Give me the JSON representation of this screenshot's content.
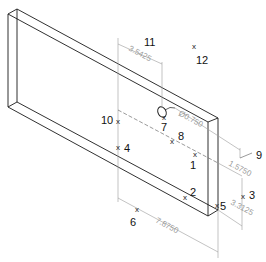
{
  "drawing": {
    "view": "isometric",
    "part": "rectangular plate with hole",
    "colors": {
      "outline": "#1a1a1a",
      "dimension": "#9a9a9a",
      "label": "#111111"
    }
  },
  "dimensions": [
    {
      "id": "dim-width-offset",
      "value": "3.5425"
    },
    {
      "id": "dim-hole-diameter",
      "value": "Ø0.750"
    },
    {
      "id": "dim-right-offset",
      "value": "1.5750"
    },
    {
      "id": "dim-height",
      "value": "3.3125"
    },
    {
      "id": "dim-length",
      "value": "7.8750"
    }
  ],
  "points": [
    {
      "id": "1",
      "label": "1"
    },
    {
      "id": "2",
      "label": "2"
    },
    {
      "id": "3",
      "label": "3"
    },
    {
      "id": "4",
      "label": "4"
    },
    {
      "id": "5",
      "label": "5"
    },
    {
      "id": "6",
      "label": "6"
    },
    {
      "id": "7",
      "label": "7"
    },
    {
      "id": "8",
      "label": "8"
    },
    {
      "id": "9",
      "label": "9"
    },
    {
      "id": "10",
      "label": "10"
    },
    {
      "id": "11",
      "label": "11"
    },
    {
      "id": "12",
      "label": "12"
    }
  ],
  "marker_glyph": "x"
}
